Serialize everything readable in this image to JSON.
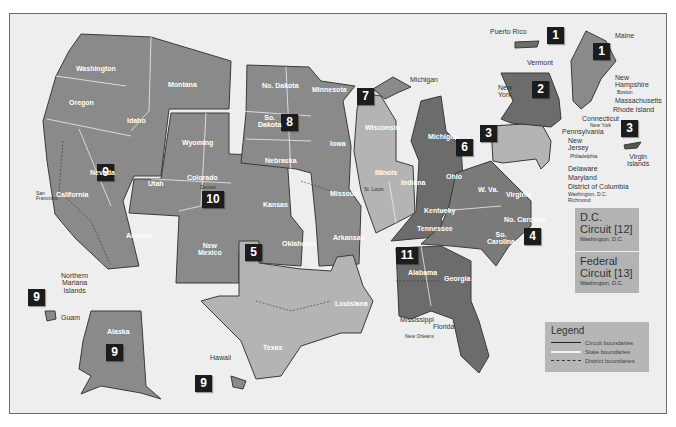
{
  "map": {
    "title_hidden": "",
    "circuits": [
      {
        "number": "1",
        "label": "1"
      },
      {
        "number": "2",
        "label": "2"
      },
      {
        "number": "3",
        "label": "3"
      },
      {
        "number": "4",
        "label": "4"
      },
      {
        "number": "5",
        "label": "5"
      },
      {
        "number": "6",
        "label": "6"
      },
      {
        "number": "7",
        "label": "7"
      },
      {
        "number": "8",
        "label": "8"
      },
      {
        "number": "9",
        "label": "9"
      },
      {
        "number": "10",
        "label": "10"
      },
      {
        "number": "11",
        "label": "11"
      }
    ],
    "states": {
      "washington": "Washington",
      "oregon": "Oregon",
      "idaho": "Idaho",
      "montana": "Montana",
      "nevada": "Nevada",
      "california": "California",
      "arizona": "Arizona",
      "utah": "Utah",
      "wyoming": "Wyoming",
      "colorado": "Colorado",
      "new_mexico_1": "New",
      "new_mexico_2": "Mexico",
      "kansas": "Kansas",
      "oklahoma": "Oklahoma",
      "nodakota": "No. Dakota",
      "sodakota_1": "So.",
      "sodakota_2": "Dakota",
      "nebraska": "Nebraska",
      "minnesota": "Minnesota",
      "iowa": "Iowa",
      "missouri": "Missouri",
      "arkansas": "Arkansas",
      "texas": "Texas",
      "louisiana": "Louisiana",
      "mississippi": "Mississippi",
      "wisconsin": "Wisconsin",
      "illinois": "Illinois",
      "indiana": "Indiana",
      "michigan_up": "Michigan",
      "michigan": "Michigan",
      "ohio": "Ohio",
      "kentucky": "Kentucky",
      "tennessee": "Tennessee",
      "alabama": "Alabama",
      "georgia": "Georgia",
      "florida": "Florida",
      "wva": "W. Va.",
      "virginia": "Virginia",
      "nocarolina": "No. Carolina",
      "socarolina_1": "So.",
      "socarolina_2": "Carolina",
      "pennsylvania": "Pennsylvania",
      "newyork_1": "New",
      "newyork_2": "York",
      "vermont": "Vermont",
      "maine": "Maine",
      "newhampshire_1": "New",
      "newhampshire_2": "Hampshire",
      "massachusetts": "Massachusetts",
      "rhodeisland": "Rhode Island",
      "connecticut": "Connecticut",
      "newjersey_1": "New",
      "newjersey_2": "Jersey",
      "delaware": "Delaware",
      "maryland": "Maryland",
      "dc": "District of Columbia",
      "alaska": "Alaska",
      "hawaii": "Hawaii"
    },
    "territories": {
      "puerto_rico": "Puerto Rico",
      "virgin_islands_1": "Virgin",
      "virgin_islands_2": "Islands",
      "guam": "Guam",
      "nmi_1": "Northern",
      "nmi_2": "Mariana",
      "nmi_3": "Islands"
    },
    "cities": {
      "san_francisco_1": "San",
      "san_francisco_2": "Francisco",
      "denver": "Denver",
      "chicago": "Chicago",
      "st_louis": "St. Louis",
      "cincinnati": "Cincinnati",
      "new_orleans": "New Orleans",
      "atlanta": "Atlanta",
      "richmond": "Richmond",
      "washington_dc": "Washington, D.C.",
      "philadelphia": "Philadelphia",
      "new_york": "New York",
      "boston": "Boston"
    },
    "districts": [
      "W",
      "E",
      "N",
      "C",
      "S",
      "M"
    ],
    "special_circuits": [
      {
        "name_1": "D.C.",
        "name_2": "Circuit [12]",
        "seat": "Washington, D.C."
      },
      {
        "name_1": "Federal",
        "name_2": "Circuit [13]",
        "seat": "Washington, D.C."
      }
    ],
    "legend": {
      "title": "Legend",
      "items": [
        {
          "label": "Circuit boundaries",
          "style": "solid-dark"
        },
        {
          "label": "State boundaries",
          "style": "solid-white"
        },
        {
          "label": "District boundaries",
          "style": "dashed-dark"
        }
      ]
    },
    "colors": {
      "background": "#eeeeee",
      "circuit_mid": "#8a8a8a",
      "circuit_dark": "#6c6c6c",
      "circuit_light": "#b4b4b4",
      "badge": "#1c1c1c",
      "legend_bg": "#b6b6b6"
    }
  }
}
